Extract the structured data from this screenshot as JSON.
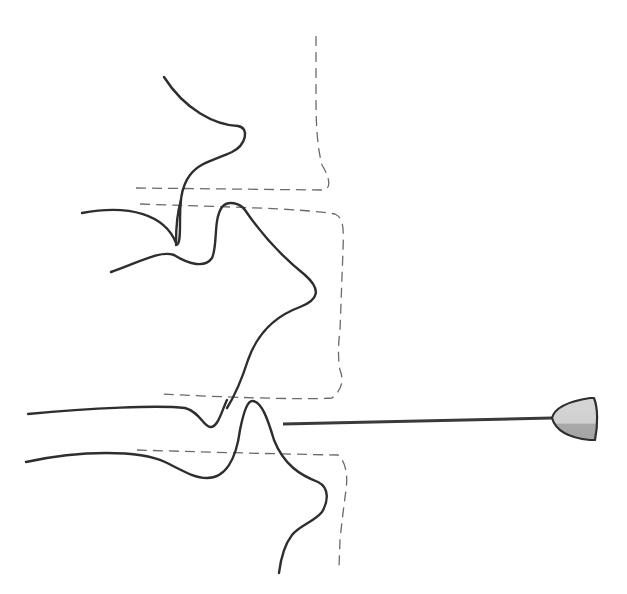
{
  "diagram": {
    "type": "line-illustration",
    "colors": {
      "background": "#ffffff",
      "solid_line": "#2e2e2e",
      "dashed_line": "#6a6a6a",
      "tip_fill_light": "#d4d4d4",
      "tip_fill_dark": "#a8a8a8"
    },
    "elements": [
      {
        "name": "upper-contour",
        "style": "solid"
      },
      {
        "name": "middle-contour",
        "style": "solid"
      },
      {
        "name": "lower-left-contour-top",
        "style": "solid"
      },
      {
        "name": "lower-left-contour-bottom",
        "style": "solid"
      },
      {
        "name": "dashed-outline-upper",
        "style": "dashed"
      },
      {
        "name": "dashed-outline-middle",
        "style": "dashed"
      },
      {
        "name": "dashed-outline-lower",
        "style": "dashed"
      },
      {
        "name": "probe-rod",
        "style": "solid"
      },
      {
        "name": "probe-tip",
        "style": "filled"
      }
    ]
  }
}
